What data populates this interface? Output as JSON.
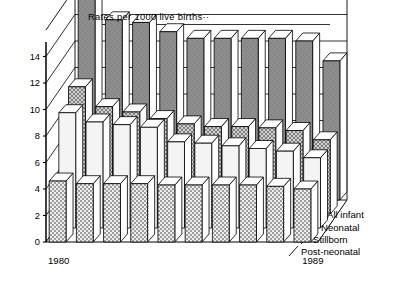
{
  "chart_data": {
    "type": "bar",
    "title": "Rates per 1000 live births··",
    "subtitle": "",
    "xlabel": "",
    "ylabel": "",
    "ylim": [
      0,
      16
    ],
    "yticks": [
      0,
      2,
      4,
      6,
      8,
      10,
      12,
      14
    ],
    "ytick_labels": [
      "0",
      "2",
      "4",
      "6",
      "8",
      "10",
      "12",
      "14"
    ],
    "grid": true,
    "grid_orientation": "horizontal",
    "legend_position": "right-inline-3d-rows",
    "projection": "3d",
    "categories": [
      "1980",
      "1981",
      "1982",
      "1983",
      "1984",
      "1985",
      "1986",
      "1987",
      "1988",
      "1989"
    ],
    "xtick_labels_shown": [
      "1980",
      "1989"
    ],
    "series": [
      {
        "name": "All infant",
        "row": 1,
        "fill": "dark-gray",
        "color": "#8a8a8a",
        "values": [
          15.5,
          13.6,
          13.4,
          12.7,
          12.2,
          12.2,
          12.2,
          12.2,
          12.0,
          10.5
        ]
      },
      {
        "name": "Neonatal",
        "row": 2,
        "fill": "cross-hatch",
        "color": "#b9b9b9",
        "values": [
          9.6,
          8.1,
          7.7,
          7.2,
          6.8,
          6.6,
          6.6,
          6.5,
          6.3,
          5.6
        ]
      },
      {
        "name": "Stillborn",
        "row": 3,
        "fill": "light",
        "color": "#f2f2f2",
        "values": [
          8.7,
          8.0,
          7.8,
          7.6,
          6.5,
          6.4,
          6.2,
          6.0,
          5.8,
          5.3
        ]
      },
      {
        "name": "Post-neonatal",
        "row": 4,
        "fill": "checker",
        "color": "#d6d6d6",
        "values": [
          4.6,
          4.4,
          4.4,
          4.4,
          4.3,
          4.3,
          4.3,
          4.3,
          4.2,
          4.0
        ]
      }
    ]
  },
  "legend": {
    "items": [
      {
        "label": "All infant"
      },
      {
        "label": "Neonatal"
      },
      {
        "label": "Stillborn"
      },
      {
        "label": "Post-neonatal"
      }
    ]
  }
}
